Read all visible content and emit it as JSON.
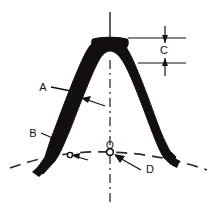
{
  "diagram": {
    "background_color": "#ffffff",
    "ink_color": "#111111",
    "arch_fill_color": "#120f0e",
    "labels": {
      "a": "A",
      "b": "B",
      "c": "C",
      "d": "D",
      "origin": "O"
    },
    "annotations": [
      {
        "key": "a",
        "text": "A",
        "x": 43,
        "y": 88,
        "points_to": "left limb of arch"
      },
      {
        "key": "b",
        "text": "B",
        "x": 33,
        "y": 134,
        "points_to": "lower left bend of arch"
      },
      {
        "key": "c",
        "text": "C",
        "x": 164,
        "y": 50,
        "points_to": "vertical dimension at crown"
      },
      {
        "key": "d",
        "text": "D",
        "x": 150,
        "y": 170,
        "points_to": "origin point O"
      },
      {
        "key": "origin",
        "text": "O",
        "x": 110,
        "y": 153,
        "points_to": "intersection of centerline and baseline"
      }
    ],
    "lines": {
      "centerline_style": "solid above crown, dash-dot below",
      "baseline_style": "dashed arc through O"
    }
  }
}
